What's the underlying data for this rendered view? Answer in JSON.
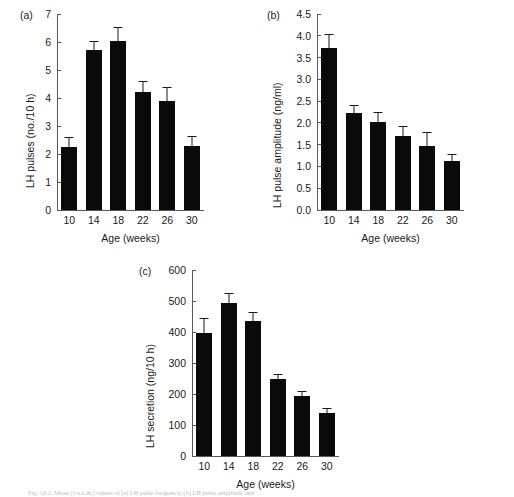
{
  "figure": {
    "background_color": "#ffffff",
    "bar_color": "#0a0a0a",
    "axis_color": "#55585c",
    "caption": "Fig. 10.2. Mean (± s.e.m.) values of (a) LH pulse frequency, (b) LH pulse amplitude and"
  },
  "panels": [
    {
      "tag": "(a)",
      "ylabel": "LH pulses (no./10 h)",
      "xlabel": "Age (weeks)",
      "yticks": [
        "0",
        "1",
        "2",
        "3",
        "4",
        "5",
        "6",
        "7"
      ],
      "xticks": [
        "10",
        "14",
        "18",
        "22",
        "26",
        "30"
      ]
    },
    {
      "tag": "(b)",
      "ylabel": "LH pulse amplitude (ng/ml)",
      "xlabel": "Age (weeks)",
      "yticks": [
        "0.0",
        "0.5",
        "1.0",
        "1.5",
        "2.0",
        "2.5",
        "3.0",
        "3.5",
        "4.0",
        "4.5"
      ],
      "xticks": [
        "10",
        "14",
        "18",
        "22",
        "26",
        "30"
      ]
    },
    {
      "tag": "(c)",
      "ylabel": "LH secretion (ng/10 h)",
      "xlabel": "Age (weeks)",
      "yticks": [
        "0",
        "100",
        "200",
        "300",
        "400",
        "500",
        "600"
      ],
      "xticks": [
        "10",
        "14",
        "18",
        "22",
        "26",
        "30"
      ]
    }
  ],
  "chart_data": [
    {
      "type": "bar",
      "panel": "(a)",
      "title": "",
      "xlabel": "Age (weeks)",
      "ylabel": "LH pulses (no./10 h)",
      "categories": [
        "10",
        "14",
        "18",
        "22",
        "26",
        "30"
      ],
      "values": [
        2.25,
        5.7,
        6.05,
        4.2,
        3.9,
        2.3
      ],
      "errors": [
        0.35,
        0.35,
        0.5,
        0.4,
        0.5,
        0.35
      ],
      "ylim": [
        0,
        7
      ],
      "ytick_step": 1,
      "grid": false,
      "legend": "none"
    },
    {
      "type": "bar",
      "panel": "(b)",
      "title": "",
      "xlabel": "Age (weeks)",
      "ylabel": "LH pulse amplitude (ng/ml)",
      "categories": [
        "10",
        "14",
        "18",
        "22",
        "26",
        "30"
      ],
      "values": [
        3.73,
        2.22,
        2.03,
        1.7,
        1.48,
        1.12
      ],
      "errors": [
        0.3,
        0.18,
        0.22,
        0.22,
        0.3,
        0.17
      ],
      "ylim": [
        0,
        4.5
      ],
      "ytick_step": 0.5,
      "grid": false,
      "legend": "none"
    },
    {
      "type": "bar",
      "panel": "(c)",
      "title": "",
      "xlabel": "Age (weeks)",
      "ylabel": "LH secretion (ng/10 h)",
      "categories": [
        "10",
        "14",
        "18",
        "22",
        "26",
        "30"
      ],
      "values": [
        398,
        494,
        437,
        247,
        195,
        140
      ],
      "errors": [
        48,
        33,
        28,
        17,
        16,
        16
      ],
      "ylim": [
        0,
        600
      ],
      "ytick_step": 100,
      "grid": false,
      "legend": "none"
    }
  ]
}
